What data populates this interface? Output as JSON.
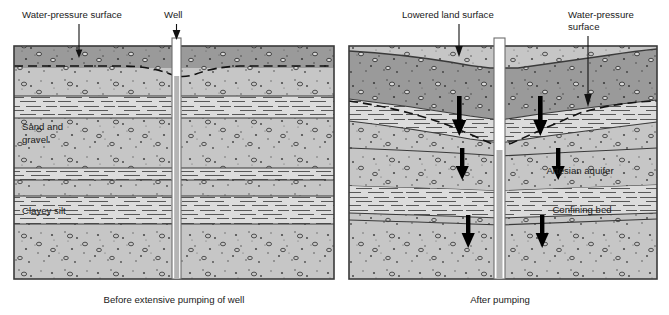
{
  "figure": {
    "panels": [
      {
        "id": "before",
        "caption": "Before extensive pumping of well",
        "callouts": [
          {
            "name": "water-pressure-surface",
            "label": "Water-pressure surface"
          },
          {
            "name": "well",
            "label": "Well"
          }
        ],
        "layer_labels": [
          {
            "name": "sand-and-gravel",
            "line1": "Sand and",
            "line2": "gravel"
          },
          {
            "name": "clayey-silt",
            "line1": "Clayey silt",
            "line2": ""
          }
        ]
      },
      {
        "id": "after",
        "caption": "After pumping",
        "callouts": [
          {
            "name": "lowered-land-surface",
            "label": "Lowered land surface"
          },
          {
            "name": "water-pressure-surface",
            "line1": "Water-pressure",
            "line2": "surface"
          }
        ],
        "layer_labels": [
          {
            "name": "artesian-aquifer",
            "line1": "Artesian aquifer",
            "line2": ""
          },
          {
            "name": "confining-bed",
            "line1": "Confining bed",
            "line2": ""
          }
        ]
      }
    ],
    "colors": {
      "topsoil_dark": "#9a9a9a",
      "gravel_light": "#c6c6c6",
      "silt_light": "#dcdcdc",
      "outline": "#3a3a3a",
      "arrow": "#000000",
      "well_fill": "#ffffff",
      "well_shadow": "#b4b4b4",
      "text": "#1a1a1a",
      "background": "#ffffff"
    },
    "legend_notes": {
      "arrow_meaning": "compaction / downward movement",
      "dashed_line_meaning": "water-pressure surface"
    }
  }
}
